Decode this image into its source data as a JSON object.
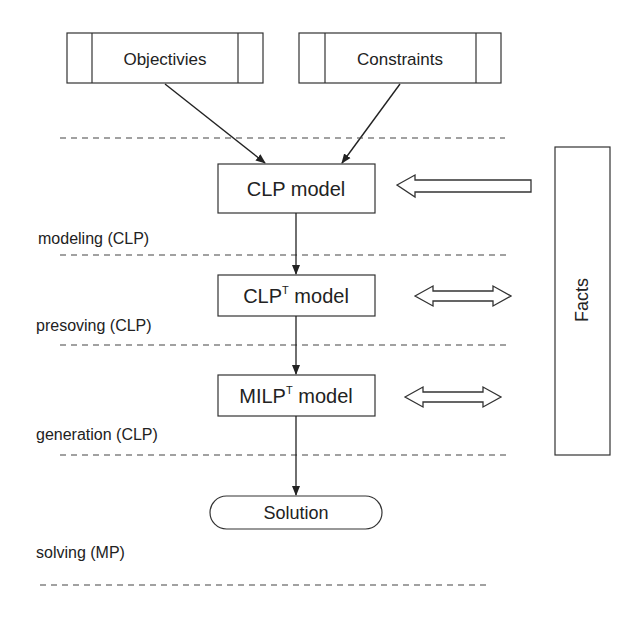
{
  "diagram": {
    "inputs": {
      "objectives": "Objectivies",
      "constraints": "Constraints"
    },
    "models": {
      "clp": "CLP model",
      "clpt_base": "CLP",
      "clpt_sup": "T",
      "clpt_rest": " model",
      "milpt_base": "MILP",
      "milpt_sup": "T",
      "milpt_rest": " model"
    },
    "solution": "Solution",
    "facts": "Facts",
    "stages": {
      "modeling": "modeling (CLP)",
      "presolving": "presoving (CLP)",
      "generation": "generation  (CLP)",
      "solving": "solving (MP)"
    }
  }
}
